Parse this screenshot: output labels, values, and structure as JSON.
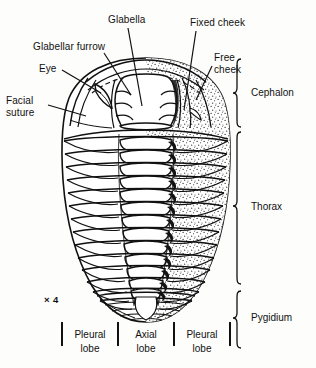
{
  "figure": {
    "kind": "trilobite-anatomy-diagram",
    "magnification": "× 4",
    "background_color": "#fdfdfb",
    "ink_color": "#111111"
  },
  "labels": {
    "glabella": "Glabella",
    "glabellar_furrow": "Glabellar furrow",
    "eye": "Eye",
    "facial_suture_line1": "Facial",
    "facial_suture_line2": "suture",
    "fixed_cheek": "Fixed cheek",
    "free_cheek_line1": "Free",
    "free_cheek_line2": "cheek"
  },
  "regions": [
    {
      "name": "cephalon",
      "label": "Cephalon"
    },
    {
      "name": "thorax",
      "label": "Thorax"
    },
    {
      "name": "pygidium",
      "label": "Pygidium"
    }
  ],
  "lobes": [
    {
      "name": "pleural-lobe-left",
      "line1": "Pleural",
      "line2": "lobe"
    },
    {
      "name": "axial-lobe",
      "line1": "Axial",
      "line2": "lobe"
    },
    {
      "name": "pleural-lobe-right",
      "line1": "Pleural",
      "line2": "lobe"
    }
  ],
  "anatomy": {
    "thorax_segment_count": 14,
    "glabella_furrow_pairs": 3,
    "body_bounds": {
      "x": 62,
      "y": 58,
      "width": 168,
      "height": 264
    }
  }
}
